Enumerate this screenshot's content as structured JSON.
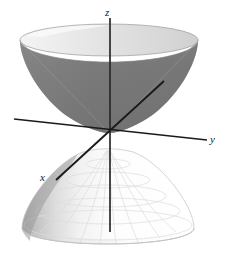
{
  "figure": {
    "title": "",
    "caption": "",
    "surface_name": "hyperboloid-of-two-sheets",
    "background_color": "#ffffff"
  },
  "axes": {
    "z": {
      "label": "z",
      "name": "z-axis",
      "color": "#1a1a1a",
      "x1": 110,
      "y1": 18,
      "x2": 110,
      "y2": 232
    },
    "y": {
      "label": "y",
      "name": "y-axis",
      "color": "#1a1a1a",
      "x1": 14,
      "y1": 119,
      "x2": 207,
      "y2": 140
    },
    "x": {
      "label": "x",
      "name": "x-axis",
      "color": "#1a1a1a",
      "x1": 164,
      "y1": 81,
      "x2": 56,
      "y2": 180
    },
    "origin": {
      "x": 103,
      "y": 130
    }
  },
  "upper_sheet": {
    "name": "upper-nappe",
    "rim_center_x": 109,
    "rim_center_y": 40,
    "rim_rx": 89,
    "rim_ry": 16,
    "vertex_x": 109,
    "vertex_y": 133,
    "top_surface_color": "#e2e2e2",
    "inner_surface_color": "#7a7a7a",
    "inner_shadow_color": "#6e6e6e",
    "rim_highlight_color": "#f2f2f2",
    "outline_color": "#9a9a9a"
  },
  "lower_sheet": {
    "name": "lower-nappe",
    "rim_center_x": 108,
    "rim_center_y": 228,
    "rim_rx": 86,
    "rim_ry": 16,
    "vertex_x": 108,
    "vertex_y": 150,
    "surface_color": "#fbfbfb",
    "shadow_color": "#b4b4b4",
    "mesh_color": "#dedede",
    "outline_color": "#cfcfcf"
  },
  "colors": {
    "ink": "#1a1a1a",
    "dark_gray": "#7a7a7a",
    "light_gray": "#e2e2e2",
    "near_white": "#fbfbfb"
  }
}
